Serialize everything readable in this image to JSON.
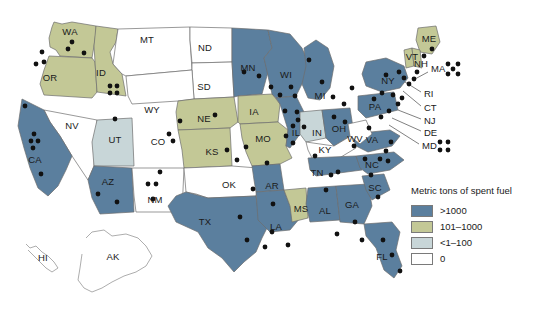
{
  "legend": {
    "title": "Metric tons of spent fuel",
    "items": [
      {
        "label": ">1000",
        "color": "#5b7f9e"
      },
      {
        "label": "101–1000",
        "color": "#c3c896"
      },
      {
        "label": "<1–100",
        "color": "#c8d6d8"
      },
      {
        "label": "0",
        "color": "#ffffff"
      }
    ]
  },
  "colors": {
    "over_1000": "#5b7f9e",
    "mid_101_1000": "#c3c896",
    "low_1_100": "#c8d6d8",
    "zero": "#ffffff",
    "border": "#6d6d6d",
    "dot": "#111111",
    "background": "#ffffff"
  },
  "map_data": {
    "type": "choropleth",
    "title": "Metric tons of spent fuel",
    "categories": [
      ">1000",
      "101–1000",
      "<1–100",
      "0"
    ],
    "states": [
      {
        "code": "WA",
        "category": "101–1000",
        "label_x": 70,
        "label_y": 32
      },
      {
        "code": "OR",
        "category": "101–1000",
        "label_x": 50,
        "label_y": 78
      },
      {
        "code": "ID",
        "category": "101–1000",
        "label_x": 101,
        "label_y": 73
      },
      {
        "code": "MT",
        "category": "0",
        "label_x": 147,
        "label_y": 40
      },
      {
        "code": "ND",
        "category": "0",
        "label_x": 205,
        "label_y": 48
      },
      {
        "code": "SD",
        "category": "0",
        "label_x": 204,
        "label_y": 87
      },
      {
        "code": "WY",
        "category": "0",
        "label_x": 152,
        "label_y": 110
      },
      {
        "code": "NV",
        "category": "0",
        "label_x": 72,
        "label_y": 126
      },
      {
        "code": "UT",
        "category": "<1–100",
        "label_x": 115,
        "label_y": 140
      },
      {
        "code": "CO",
        "category": "<1–100",
        "label_x": 158,
        "label_y": 142
      },
      {
        "code": "CA",
        "category": ">1000",
        "label_x": 35,
        "label_y": 160
      },
      {
        "code": "AZ",
        "category": ">1000",
        "label_x": 108,
        "label_y": 182
      },
      {
        "code": "NM",
        "category": "0",
        "label_x": 155,
        "label_y": 200
      },
      {
        "code": "NE",
        "category": "101–1000",
        "label_x": 204,
        "label_y": 119
      },
      {
        "code": "KS",
        "category": "101–1000",
        "label_x": 212,
        "label_y": 152
      },
      {
        "code": "OK",
        "category": "0",
        "label_x": 229,
        "label_y": 185
      },
      {
        "code": "TX",
        "category": ">1000",
        "label_x": 205,
        "label_y": 222
      },
      {
        "code": "MN",
        "category": ">1000",
        "label_x": 248,
        "label_y": 68
      },
      {
        "code": "IA",
        "category": "101–1000",
        "label_x": 254,
        "label_y": 112
      },
      {
        "code": "MO",
        "category": "101–1000",
        "label_x": 263,
        "label_y": 139
      },
      {
        "code": "AR",
        "category": ">1000",
        "label_x": 272,
        "label_y": 186
      },
      {
        "code": "LA",
        "category": ">1000",
        "label_x": 276,
        "label_y": 227
      },
      {
        "code": "WI",
        "category": ">1000",
        "label_x": 286,
        "label_y": 75
      },
      {
        "code": "IL",
        "category": ">1000",
        "label_x": 296,
        "label_y": 133
      },
      {
        "code": "MS",
        "category": "101–1000",
        "label_x": 301,
        "label_y": 209
      },
      {
        "code": "MI",
        "category": ">1000",
        "label_x": 320,
        "label_y": 96
      },
      {
        "code": "IN",
        "category": "<1–100",
        "label_x": 317,
        "label_y": 133
      },
      {
        "code": "OH",
        "category": ">1000",
        "label_x": 339,
        "label_y": 129
      },
      {
        "code": "KY",
        "category": "0",
        "label_x": 325,
        "label_y": 150
      },
      {
        "code": "TN",
        "category": ">1000",
        "label_x": 317,
        "label_y": 173
      },
      {
        "code": "AL",
        "category": ">1000",
        "label_x": 325,
        "label_y": 211
      },
      {
        "code": "GA",
        "category": ">1000",
        "label_x": 352,
        "label_y": 205
      },
      {
        "code": "FL",
        "category": ">1000",
        "label_x": 382,
        "label_y": 257
      },
      {
        "code": "SC",
        "category": ">1000",
        "label_x": 375,
        "label_y": 188
      },
      {
        "code": "NC",
        "category": ">1000",
        "label_x": 372,
        "label_y": 165
      },
      {
        "code": "VA",
        "category": ">1000",
        "label_x": 372,
        "label_y": 140
      },
      {
        "code": "WV",
        "category": "0",
        "label_x": 355,
        "label_y": 139
      },
      {
        "code": "PA",
        "category": ">1000",
        "label_x": 375,
        "label_y": 107
      },
      {
        "code": "NY",
        "category": ">1000",
        "label_x": 388,
        "label_y": 81
      },
      {
        "code": "ME",
        "category": "101–1000",
        "label_x": 429,
        "label_y": 39
      },
      {
        "code": "VT",
        "category": "101–1000",
        "label_x": 412,
        "label_y": 57
      },
      {
        "code": "NH",
        "category": "101–1000",
        "label_x": 421,
        "label_y": 64
      },
      {
        "code": "HI",
        "category": "0",
        "label_x": 43,
        "label_y": 258
      },
      {
        "code": "AK",
        "category": "0",
        "label_x": 113,
        "label_y": 257
      }
    ],
    "callouts": [
      {
        "code": "MA",
        "x": 431,
        "y": 69,
        "from_x": 428,
        "from_y": 72,
        "to_x": 415,
        "to_y": 79
      },
      {
        "code": "RI",
        "x": 424,
        "y": 94,
        "from_x": 421,
        "from_y": 92,
        "to_x": 405,
        "to_y": 82
      },
      {
        "code": "CT",
        "x": 424,
        "y": 108,
        "from_x": 421,
        "from_y": 106,
        "to_x": 403,
        "to_y": 91
      },
      {
        "code": "NJ",
        "x": 424,
        "y": 121,
        "from_x": 421,
        "from_y": 119,
        "to_x": 398,
        "to_y": 110
      },
      {
        "code": "DE",
        "x": 424,
        "y": 133,
        "from_x": 421,
        "from_y": 131,
        "to_x": 392,
        "to_y": 118
      },
      {
        "code": "MD",
        "x": 422,
        "y": 146,
        "from_x": 419,
        "from_y": 144,
        "to_x": 389,
        "to_y": 125
      }
    ],
    "external_dot_clusters": [
      {
        "state": "MA",
        "pattern": "x-5",
        "count": 5,
        "x": 453,
        "y": 69
      },
      {
        "state": "MD",
        "pattern": "grid-4",
        "count": 4,
        "x": 444,
        "y": 146
      }
    ],
    "reactor_sites": [
      {
        "x": 42,
        "y": 52
      },
      {
        "x": 44,
        "y": 62
      },
      {
        "x": 36,
        "y": 64
      },
      {
        "x": 68,
        "y": 49
      },
      {
        "x": 72,
        "y": 42
      },
      {
        "x": 84,
        "y": 53
      },
      {
        "x": 110,
        "y": 86
      },
      {
        "x": 117,
        "y": 86
      },
      {
        "x": 110,
        "y": 93
      },
      {
        "x": 117,
        "y": 93
      },
      {
        "x": 115,
        "y": 119
      },
      {
        "x": 25,
        "y": 106
      },
      {
        "x": 34,
        "y": 134
      },
      {
        "x": 31,
        "y": 141
      },
      {
        "x": 38,
        "y": 141
      },
      {
        "x": 33,
        "y": 148
      },
      {
        "x": 41,
        "y": 174
      },
      {
        "x": 98,
        "y": 194
      },
      {
        "x": 117,
        "y": 202
      },
      {
        "x": 160,
        "y": 172
      },
      {
        "x": 148,
        "y": 184
      },
      {
        "x": 156,
        "y": 184
      },
      {
        "x": 153,
        "y": 199
      },
      {
        "x": 169,
        "y": 134
      },
      {
        "x": 173,
        "y": 141
      },
      {
        "x": 180,
        "y": 121
      },
      {
        "x": 215,
        "y": 115
      },
      {
        "x": 227,
        "y": 150
      },
      {
        "x": 237,
        "y": 160
      },
      {
        "x": 246,
        "y": 147
      },
      {
        "x": 244,
        "y": 72
      },
      {
        "x": 259,
        "y": 76
      },
      {
        "x": 271,
        "y": 87
      },
      {
        "x": 280,
        "y": 95
      },
      {
        "x": 291,
        "y": 87
      },
      {
        "x": 295,
        "y": 96
      },
      {
        "x": 285,
        "y": 111
      },
      {
        "x": 297,
        "y": 112
      },
      {
        "x": 298,
        "y": 120
      },
      {
        "x": 293,
        "y": 126
      },
      {
        "x": 304,
        "y": 127
      },
      {
        "x": 286,
        "y": 136
      },
      {
        "x": 293,
        "y": 143
      },
      {
        "x": 309,
        "y": 60
      },
      {
        "x": 322,
        "y": 82
      },
      {
        "x": 333,
        "y": 97
      },
      {
        "x": 344,
        "y": 104
      },
      {
        "x": 352,
        "y": 88
      },
      {
        "x": 334,
        "y": 117
      },
      {
        "x": 345,
        "y": 122
      },
      {
        "x": 315,
        "y": 156
      },
      {
        "x": 267,
        "y": 163
      },
      {
        "x": 253,
        "y": 189
      },
      {
        "x": 273,
        "y": 204
      },
      {
        "x": 240,
        "y": 217
      },
      {
        "x": 272,
        "y": 232
      },
      {
        "x": 247,
        "y": 240
      },
      {
        "x": 265,
        "y": 247
      },
      {
        "x": 288,
        "y": 245
      },
      {
        "x": 337,
        "y": 234
      },
      {
        "x": 331,
        "y": 175
      },
      {
        "x": 338,
        "y": 172
      },
      {
        "x": 326,
        "y": 190
      },
      {
        "x": 355,
        "y": 222
      },
      {
        "x": 362,
        "y": 240
      },
      {
        "x": 378,
        "y": 197
      },
      {
        "x": 383,
        "y": 240
      },
      {
        "x": 392,
        "y": 255
      },
      {
        "x": 400,
        "y": 271
      },
      {
        "x": 365,
        "y": 159
      },
      {
        "x": 380,
        "y": 159
      },
      {
        "x": 388,
        "y": 161
      },
      {
        "x": 371,
        "y": 175
      },
      {
        "x": 386,
        "y": 151
      },
      {
        "x": 391,
        "y": 142
      },
      {
        "x": 369,
        "y": 128
      },
      {
        "x": 381,
        "y": 117
      },
      {
        "x": 389,
        "y": 111
      },
      {
        "x": 374,
        "y": 99
      },
      {
        "x": 382,
        "y": 93
      },
      {
        "x": 393,
        "y": 95
      },
      {
        "x": 398,
        "y": 104
      },
      {
        "x": 402,
        "y": 98
      },
      {
        "x": 386,
        "y": 75
      },
      {
        "x": 399,
        "y": 72
      },
      {
        "x": 404,
        "y": 78
      },
      {
        "x": 409,
        "y": 84
      },
      {
        "x": 414,
        "y": 79
      },
      {
        "x": 417,
        "y": 72
      },
      {
        "x": 424,
        "y": 56
      },
      {
        "x": 432,
        "y": 49
      },
      {
        "x": 354,
        "y": 146
      }
    ]
  }
}
